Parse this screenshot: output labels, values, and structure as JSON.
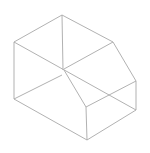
{
  "diagram": {
    "type": "isometric-wireframe",
    "stroke_color": "#a8a8a8",
    "background": "#ffffff",
    "edges": [
      [
        62,
        15,
        14,
        42
      ],
      [
        62,
        15,
        113,
        42
      ],
      [
        62,
        15,
        63,
        70
      ],
      [
        14,
        42,
        14,
        99
      ],
      [
        14,
        42,
        136,
        110
      ],
      [
        113,
        42,
        64,
        69
      ],
      [
        113,
        42,
        136,
        81
      ],
      [
        136,
        81,
        136,
        110
      ],
      [
        136,
        81,
        86,
        107
      ],
      [
        64,
        70,
        86,
        107
      ],
      [
        62,
        75,
        14,
        99
      ],
      [
        14,
        99,
        87,
        140
      ],
      [
        86,
        107,
        87,
        140
      ],
      [
        87,
        140,
        136,
        110
      ]
    ]
  }
}
